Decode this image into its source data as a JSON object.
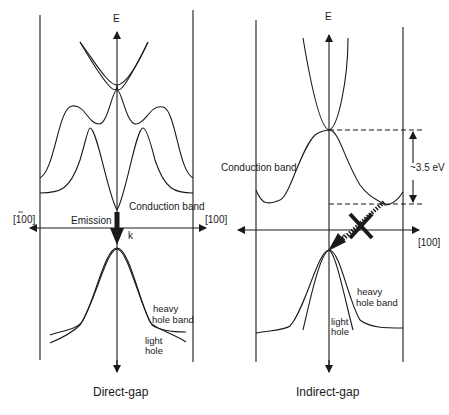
{
  "left_panel": {
    "title": "Direct-gap",
    "axis_e": "E",
    "axis_k": "k",
    "dir_left": "[100]",
    "dir_right": "[100]",
    "emission": "Emission",
    "conduction": "Conduction band",
    "heavy_1": "heavy",
    "heavy_2": "hole band",
    "light_1": "light",
    "light_2": "hole"
  },
  "right_panel": {
    "title": "Indirect-gap",
    "axis_e": "E",
    "dir_right": "[100]",
    "conduction": "Conduction band",
    "gap": "~3.5 eV",
    "heavy_1": "heavy",
    "heavy_2": "hole band",
    "light_1": "light",
    "light_2": "hole"
  },
  "colors": {
    "line": "#1a1a1a",
    "background": "#ffffff"
  }
}
